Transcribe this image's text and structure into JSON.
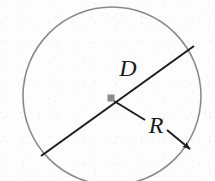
{
  "figure": {
    "background_color": "#fdfdfd",
    "circle": {
      "name": "circle-outline",
      "center_x": 112,
      "center_y": 96,
      "radius": 89,
      "stroke_color": "#8a8a8a",
      "stroke_width": 1.6,
      "fill": "none"
    },
    "center_point": {
      "name": "center-dot",
      "x": 111,
      "y": 98,
      "size": 7,
      "color": "#8c8c8c",
      "shape": "square"
    },
    "diameter_line": {
      "name": "diameter-line",
      "x1": 41,
      "y1": 156,
      "x2": 194,
      "y2": 46,
      "stroke_color": "#1f1f1f",
      "stroke_width": 2.1
    },
    "radius_arrow": {
      "name": "radius-arrow",
      "x1": 116,
      "y1": 103,
      "x2": 192,
      "y2": 151,
      "stroke_color": "#1f1f1f",
      "stroke_width": 2.0,
      "arrowhead": "filled-triangle",
      "gap_for_label": true
    },
    "labels": {
      "diameter": "D",
      "radius": "R"
    },
    "label_positions": {
      "diameter": {
        "x": 128,
        "y": 68
      },
      "radius": {
        "x": 156,
        "y": 125
      }
    }
  }
}
